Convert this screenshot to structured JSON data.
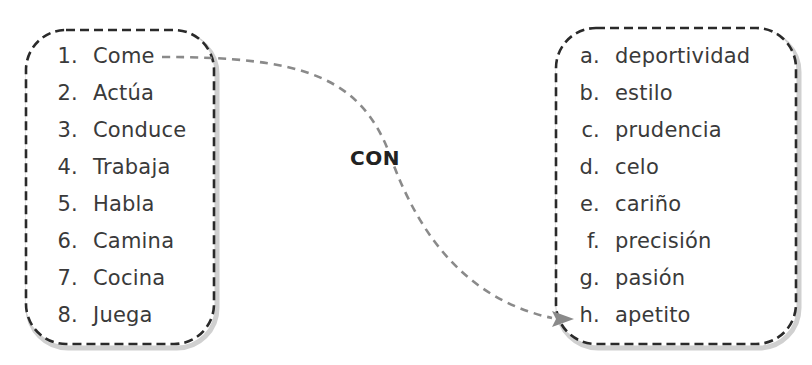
{
  "connector_label": "CON",
  "left_column": {
    "items": [
      {
        "key": "1.",
        "word": "Come"
      },
      {
        "key": "2.",
        "word": "Actúa"
      },
      {
        "key": "3.",
        "word": "Conduce"
      },
      {
        "key": "4.",
        "word": "Trabaja"
      },
      {
        "key": "5.",
        "word": "Habla"
      },
      {
        "key": "6.",
        "word": "Camina"
      },
      {
        "key": "7.",
        "word": "Cocina"
      },
      {
        "key": "8.",
        "word": "Juega"
      }
    ]
  },
  "right_column": {
    "items": [
      {
        "key": "a.",
        "word": "deportividad"
      },
      {
        "key": "b.",
        "word": "estilo"
      },
      {
        "key": "c.",
        "word": "prudencia"
      },
      {
        "key": "d.",
        "word": "celo"
      },
      {
        "key": "e.",
        "word": "cariño"
      },
      {
        "key": "f.",
        "word": "precisión"
      },
      {
        "key": "g.",
        "word": "pasión"
      },
      {
        "key": "h.",
        "word": "apetito"
      }
    ]
  },
  "example_match": {
    "from": "1. Come",
    "to": "h. apetito"
  },
  "colors": {
    "box_border": "#2a2a2a",
    "box_shadow": "#c8c8c8",
    "connector": "#8a8a8a",
    "text": "#3a3a3a"
  }
}
